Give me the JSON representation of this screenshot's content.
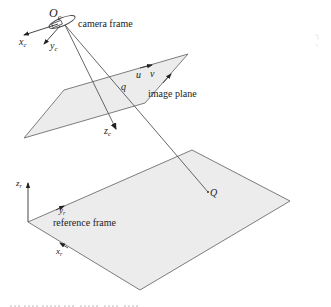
{
  "figure": {
    "camera": {
      "origin_label": "O",
      "origin_sub": "c",
      "frame_label": "camera frame",
      "x_axis_label": "x",
      "x_axis_sub": "c",
      "y_axis_label": "y",
      "y_axis_sub": "c",
      "z_axis_label": "z",
      "z_axis_sub": "c"
    },
    "image_plane": {
      "label": "image plane",
      "u_label": "u",
      "v_label": "v",
      "point_label": "q"
    },
    "reference_frame": {
      "label": "reference frame",
      "x_axis_label": "x",
      "x_axis_sub": "r",
      "y_axis_label": "y",
      "y_axis_sub": "r",
      "z_axis_label": "z",
      "z_axis_sub": "r"
    },
    "world_point_label": "Q",
    "colors": {
      "plane_fill": "#ececec",
      "plane_stroke": "#6e6e6e",
      "line": "#555555"
    }
  }
}
